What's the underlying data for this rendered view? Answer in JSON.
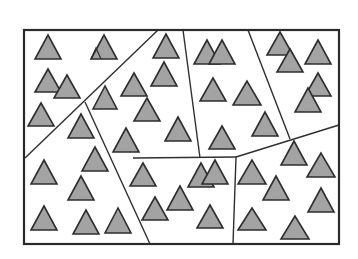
{
  "diagram": {
    "colors": {
      "background": "#ffffff",
      "line": "#2f2f2f",
      "triangle_fill": "#a3a3a3",
      "triangle_stroke": "#2e2e2e"
    },
    "frame": {
      "x": 24,
      "y": 30,
      "width": 315,
      "height": 214
    },
    "dividers": [
      {
        "id": "d1",
        "x1": 158,
        "y1": 30,
        "x2": 25,
        "y2": 158
      },
      {
        "id": "d2",
        "x1": 85,
        "y1": 102,
        "x2": 150,
        "y2": 244
      },
      {
        "id": "d3",
        "x1": 183,
        "y1": 30,
        "x2": 200,
        "y2": 158
      },
      {
        "id": "d4",
        "x1": 248,
        "y1": 30,
        "x2": 290,
        "y2": 139
      },
      {
        "id": "d5",
        "x1": 133,
        "y1": 158,
        "x2": 236,
        "y2": 157
      },
      {
        "id": "d6",
        "x1": 236,
        "y1": 157,
        "x2": 339,
        "y2": 125
      },
      {
        "id": "d7",
        "x1": 236,
        "y1": 157,
        "x2": 233,
        "y2": 244
      }
    ],
    "triangles": [
      {
        "ax": 48,
        "ay": 35,
        "by": 59,
        "hw": 13
      },
      {
        "ax": 104,
        "ay": 35,
        "by": 59,
        "hw": 13
      },
      {
        "ax": 48,
        "ay": 69,
        "by": 92,
        "hw": 13
      },
      {
        "ax": 67,
        "ay": 75,
        "by": 98,
        "hw": 13
      },
      {
        "ax": 41,
        "ay": 103,
        "by": 126,
        "hw": 13
      },
      {
        "ax": 105,
        "ay": 86,
        "by": 109,
        "hw": 12
      },
      {
        "ax": 134,
        "ay": 73,
        "by": 96,
        "hw": 13
      },
      {
        "ax": 81,
        "ay": 114,
        "by": 138,
        "hw": 13
      },
      {
        "ax": 95,
        "ay": 147,
        "by": 171,
        "hw": 13
      },
      {
        "ax": 44,
        "ay": 160,
        "by": 184,
        "hw": 13
      },
      {
        "ax": 81,
        "ay": 176,
        "by": 200,
        "hw": 13
      },
      {
        "ax": 44,
        "ay": 206,
        "by": 230,
        "hw": 13
      },
      {
        "ax": 86,
        "ay": 210,
        "by": 234,
        "hw": 13
      },
      {
        "ax": 118,
        "ay": 208,
        "by": 233,
        "hw": 13
      },
      {
        "ax": 126,
        "ay": 128,
        "by": 152,
        "hw": 13
      },
      {
        "ax": 166,
        "ay": 34,
        "by": 58,
        "hw": 13
      },
      {
        "ax": 164,
        "ay": 62,
        "by": 86,
        "hw": 13
      },
      {
        "ax": 147,
        "ay": 98,
        "by": 121,
        "hw": 13
      },
      {
        "ax": 178,
        "ay": 117,
        "by": 141,
        "hw": 13
      },
      {
        "ax": 207,
        "ay": 40,
        "by": 64,
        "hw": 13
      },
      {
        "ax": 222,
        "ay": 40,
        "by": 64,
        "hw": 13
      },
      {
        "ax": 213,
        "ay": 78,
        "by": 101,
        "hw": 13
      },
      {
        "ax": 247,
        "ay": 81,
        "by": 105,
        "hw": 14
      },
      {
        "ax": 222,
        "ay": 126,
        "by": 149,
        "hw": 13
      },
      {
        "ax": 265,
        "ay": 112,
        "by": 136,
        "hw": 13
      },
      {
        "ax": 280,
        "ay": 32,
        "by": 55,
        "hw": 13
      },
      {
        "ax": 290,
        "ay": 49,
        "by": 72,
        "hw": 13
      },
      {
        "ax": 318,
        "ay": 40,
        "by": 64,
        "hw": 13
      },
      {
        "ax": 318,
        "ay": 73,
        "by": 96,
        "hw": 13
      },
      {
        "ax": 308,
        "ay": 88,
        "by": 112,
        "hw": 13
      },
      {
        "ax": 143,
        "ay": 163,
        "by": 186,
        "hw": 13
      },
      {
        "ax": 201,
        "ay": 163,
        "by": 187,
        "hw": 13
      },
      {
        "ax": 215,
        "ay": 160,
        "by": 184,
        "hw": 13
      },
      {
        "ax": 180,
        "ay": 186,
        "by": 210,
        "hw": 13
      },
      {
        "ax": 155,
        "ay": 197,
        "by": 220,
        "hw": 13
      },
      {
        "ax": 210,
        "ay": 205,
        "by": 228,
        "hw": 13
      },
      {
        "ax": 294,
        "ay": 141,
        "by": 165,
        "hw": 13
      },
      {
        "ax": 252,
        "ay": 160,
        "by": 184,
        "hw": 14
      },
      {
        "ax": 321,
        "ay": 153,
        "by": 177,
        "hw": 14
      },
      {
        "ax": 276,
        "ay": 176,
        "by": 200,
        "hw": 13
      },
      {
        "ax": 321,
        "ay": 188,
        "by": 212,
        "hw": 13
      },
      {
        "ax": 252,
        "ay": 208,
        "by": 230,
        "hw": 14
      },
      {
        "ax": 295,
        "ay": 216,
        "by": 239,
        "hw": 14
      }
    ],
    "inner_marks": [
      {
        "ax": 96,
        "ay": 48,
        "by": 59,
        "hw": 5
      }
    ]
  }
}
